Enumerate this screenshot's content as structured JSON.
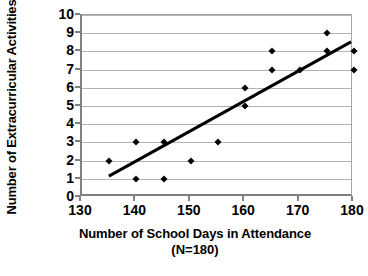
{
  "chart_data": {
    "type": "scatter",
    "title": "",
    "xlabel": "Number of School Days in Attendance",
    "xlabel_line2": "(N=180)",
    "ylabel": "Number of Extracurricular Activities",
    "xlim": [
      130,
      180
    ],
    "ylim": [
      0,
      10
    ],
    "xticks": [
      130,
      140,
      150,
      160,
      170,
      180
    ],
    "yticks": [
      0,
      1,
      2,
      3,
      4,
      5,
      6,
      7,
      8,
      9,
      10
    ],
    "grid": "horizontal",
    "legend": "none",
    "marker": "diamond",
    "marker_color": "#000000",
    "points": [
      {
        "x": 135,
        "y": 2
      },
      {
        "x": 140,
        "y": 3
      },
      {
        "x": 140,
        "y": 1
      },
      {
        "x": 145,
        "y": 3
      },
      {
        "x": 145,
        "y": 1
      },
      {
        "x": 150,
        "y": 2
      },
      {
        "x": 155,
        "y": 3
      },
      {
        "x": 160,
        "y": 6
      },
      {
        "x": 160,
        "y": 5
      },
      {
        "x": 165,
        "y": 8
      },
      {
        "x": 165,
        "y": 7
      },
      {
        "x": 170,
        "y": 7
      },
      {
        "x": 175,
        "y": 9
      },
      {
        "x": 175,
        "y": 8
      },
      {
        "x": 180,
        "y": 8
      },
      {
        "x": 180,
        "y": 7
      }
    ],
    "trendline": {
      "type": "linear",
      "color": "#000000",
      "x_start": 135,
      "y_start": 1,
      "x_end": 180,
      "y_end": 8.5
    }
  }
}
